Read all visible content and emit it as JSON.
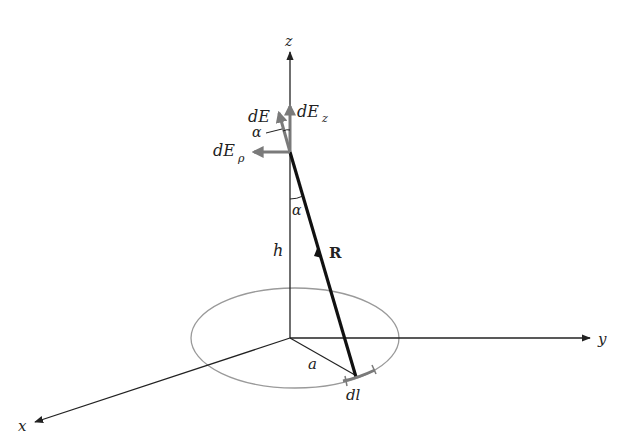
{
  "diagram": {
    "labels": {
      "z_axis": "z",
      "y_axis": "y",
      "x_axis": "x",
      "dE": "dE",
      "dEz_main": "dE",
      "dEz_sub": "z",
      "dErho_main": "dE",
      "dErho_sub": "ρ",
      "alpha_top": "α",
      "alpha_bottom": "α",
      "h": "h",
      "R": "R",
      "a": "a",
      "dl": "dl"
    },
    "colors": {
      "axis": "#222222",
      "vector_gray": "#7a7a7a",
      "ring": "#9a9a9a",
      "R_vector": "#111111"
    }
  }
}
